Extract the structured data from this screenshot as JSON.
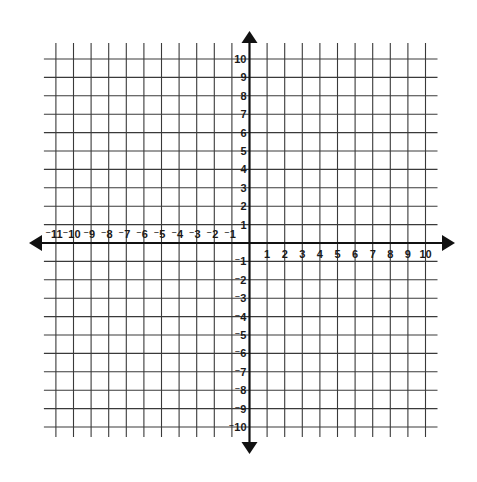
{
  "chart_data": {
    "type": "coordinate-grid",
    "title": "",
    "xlabel": "",
    "ylabel": "",
    "x_ticks": [
      -11,
      -10,
      -9,
      -8,
      -7,
      -6,
      -5,
      -4,
      -3,
      -2,
      -1,
      1,
      2,
      3,
      4,
      5,
      6,
      7,
      8,
      9,
      10
    ],
    "y_ticks": [
      10,
      9,
      8,
      7,
      6,
      5,
      4,
      3,
      2,
      1,
      -1,
      -2,
      -3,
      -4,
      -5,
      -6,
      -7,
      -8,
      -9,
      -10
    ],
    "xlim": [
      -11,
      10
    ],
    "ylim": [
      -10,
      10
    ],
    "grid": true,
    "axis_arrows": true,
    "series": []
  },
  "colors": {
    "grid": "#3a3a3a",
    "axis": "#111111",
    "labels": "#1a1a1a",
    "background": "#ffffff"
  }
}
